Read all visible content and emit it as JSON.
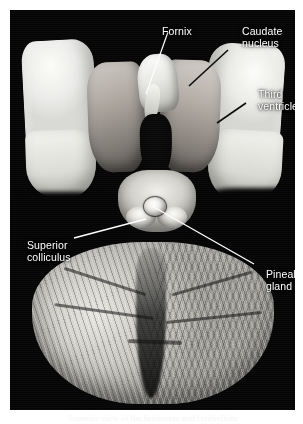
{
  "figure": {
    "kind": "anatomical-photograph",
    "background_color": "#050505",
    "label_color": "#ffffff",
    "page_color": "#ffffff"
  },
  "labels": [
    {
      "id": "fornix",
      "text": "Fornix",
      "leader": {
        "style": "white",
        "x1": 168,
        "y1": 32,
        "x2": 146,
        "y2": 94
      }
    },
    {
      "id": "caudate_nucleus",
      "text": "Caudate\nnucleus",
      "leader": {
        "style": "black",
        "x1": 228,
        "y1": 50,
        "x2": 189,
        "y2": 86
      }
    },
    {
      "id": "third_ventricle",
      "text": "Third\nventricle",
      "leader": {
        "style": "black",
        "x1": 246,
        "y1": 103,
        "x2": 217,
        "y2": 123
      }
    },
    {
      "id": "superior_colliculus",
      "text": "Superior\ncolliculus",
      "leader": {
        "style": "white",
        "x1": 74,
        "y1": 238,
        "x2": 146,
        "y2": 219
      }
    },
    {
      "id": "pineal_gland",
      "text": "Pineal\ngland",
      "leader": {
        "style": "white",
        "x1": 152,
        "y1": 206,
        "x2": 254,
        "y2": 264
      }
    }
  ],
  "caption": {
    "text": "Superior view of the brainstem and cerebellum"
  }
}
